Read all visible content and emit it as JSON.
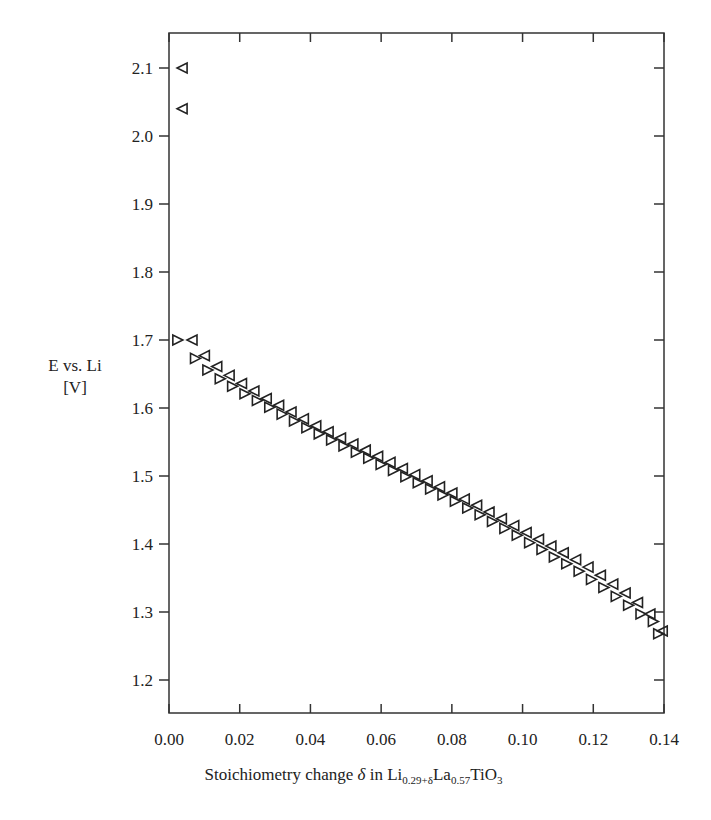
{
  "chart_data": {
    "type": "scatter",
    "title": "",
    "xlabel": "Stoichiometry change δ in Li0.29+δLa0.57TiO3",
    "xlabel_parts": {
      "pre": "Stoichiometry change ",
      "delta": "δ",
      "mid": " in Li",
      "sub1": "0.29+δ",
      "la": "La",
      "sub2": "0.57",
      "ti": "TiO",
      "sub3": "3"
    },
    "ylabel": "E vs. Li [V]",
    "ylabel_lines": [
      "E vs. Li",
      "[V]"
    ],
    "xlim": [
      0.0,
      0.14
    ],
    "ylim": [
      1.15,
      2.15
    ],
    "xticks": [
      0.0,
      0.02,
      0.04,
      0.06,
      0.08,
      0.1,
      0.12,
      0.14
    ],
    "xtick_labels": [
      "0.00",
      "0.02",
      "0.04",
      "0.06",
      "0.08",
      "0.10",
      "0.12",
      "0.14"
    ],
    "yticks": [
      1.2,
      1.3,
      1.4,
      1.5,
      1.6,
      1.7,
      1.8,
      1.9,
      2.0,
      2.1
    ],
    "ytick_labels": [
      "1.2",
      "1.3",
      "1.4",
      "1.5",
      "1.6",
      "1.7",
      "1.8",
      "1.9",
      "2.0",
      "2.1"
    ],
    "grid": false,
    "legend": null,
    "series": [
      {
        "name": "left-triangle",
        "marker": "triangle-left",
        "x": [
          0.0037,
          0.0037,
          0.0065,
          0.01,
          0.0135,
          0.017,
          0.0205,
          0.024,
          0.0275,
          0.031,
          0.0345,
          0.038,
          0.0415,
          0.045,
          0.0485,
          0.052,
          0.0555,
          0.059,
          0.0625,
          0.066,
          0.0695,
          0.073,
          0.0765,
          0.08,
          0.0835,
          0.087,
          0.0905,
          0.094,
          0.0975,
          0.101,
          0.1045,
          0.108,
          0.1115,
          0.115,
          0.1185,
          0.122,
          0.1255,
          0.129,
          0.1325,
          0.136,
          0.1395
        ],
        "y": [
          2.1,
          2.04,
          1.7,
          1.677,
          1.661,
          1.648,
          1.636,
          1.625,
          1.614,
          1.604,
          1.594,
          1.584,
          1.574,
          1.565,
          1.556,
          1.547,
          1.538,
          1.529,
          1.52,
          1.511,
          1.502,
          1.493,
          1.484,
          1.475,
          1.466,
          1.457,
          1.447,
          1.437,
          1.427,
          1.417,
          1.407,
          1.397,
          1.387,
          1.377,
          1.366,
          1.354,
          1.341,
          1.328,
          1.314,
          1.297,
          1.272
        ]
      },
      {
        "name": "right-triangle",
        "marker": "triangle-right",
        "x": [
          0.0025,
          0.0075,
          0.011,
          0.0145,
          0.018,
          0.0215,
          0.025,
          0.0285,
          0.032,
          0.0355,
          0.039,
          0.0425,
          0.046,
          0.0495,
          0.053,
          0.0565,
          0.06,
          0.0635,
          0.067,
          0.0705,
          0.074,
          0.0775,
          0.081,
          0.0845,
          0.088,
          0.0915,
          0.095,
          0.0985,
          0.102,
          0.1055,
          0.109,
          0.1125,
          0.116,
          0.1195,
          0.123,
          0.1265,
          0.13,
          0.1335,
          0.137,
          0.1385
        ],
        "y": [
          1.7,
          1.673,
          1.656,
          1.643,
          1.632,
          1.621,
          1.611,
          1.601,
          1.591,
          1.581,
          1.571,
          1.562,
          1.553,
          1.544,
          1.535,
          1.526,
          1.517,
          1.508,
          1.499,
          1.49,
          1.481,
          1.472,
          1.463,
          1.453,
          1.443,
          1.433,
          1.423,
          1.413,
          1.402,
          1.392,
          1.381,
          1.371,
          1.36,
          1.348,
          1.336,
          1.323,
          1.31,
          1.297,
          1.286,
          1.268
        ]
      }
    ]
  }
}
